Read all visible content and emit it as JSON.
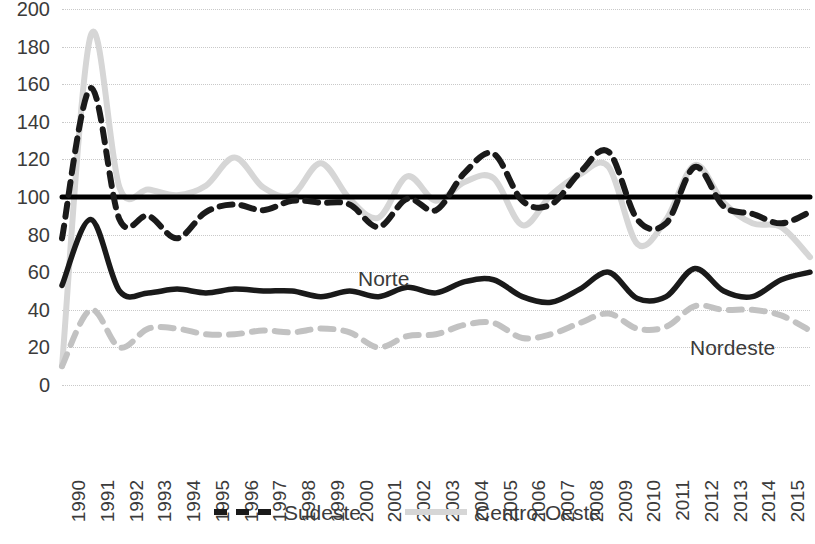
{
  "chart_data": {
    "type": "line",
    "title": "",
    "subtitle": "",
    "xlabel": "",
    "ylabel": "",
    "xlim": [
      1990,
      2016
    ],
    "ylim": [
      0,
      200
    ],
    "ytick_step": 20,
    "grid": true,
    "legend_position": "bottom",
    "x": [
      1990,
      1991,
      1992,
      1993,
      1994,
      1995,
      1996,
      1997,
      1998,
      1999,
      2000,
      2001,
      2002,
      2003,
      2004,
      2005,
      2006,
      2007,
      2008,
      2009,
      2010,
      2011,
      2012,
      2013,
      2014,
      2015,
      2016
    ],
    "categories": [
      "1990",
      "1991",
      "1992",
      "1993",
      "1994",
      "1995",
      "1996",
      "1997",
      "1998",
      "1999",
      "2000",
      "2001",
      "2002",
      "2003",
      "2004",
      "2005",
      "2006",
      "2007",
      "2008",
      "2009",
      "2010",
      "2011",
      "2012",
      "2013",
      "2014",
      "2015",
      "2016"
    ],
    "yticks": [
      "0",
      "20",
      "40",
      "60",
      "80",
      "100",
      "120",
      "140",
      "160",
      "180",
      "200"
    ],
    "series": [
      {
        "name": "Sudeste",
        "style": "dashed",
        "color": "#1a1a1a",
        "in_legend": true,
        "values": [
          78,
          158,
          88,
          90,
          78,
          92,
          96,
          93,
          98,
          97,
          96,
          84,
          99,
          93,
          113,
          123,
          98,
          96,
          113,
          124,
          88,
          86,
          116,
          95,
          91,
          86,
          92
        ]
      },
      {
        "name": "Centro-Oeste",
        "style": "solid",
        "color": "#d6d6d6",
        "in_legend": true,
        "values": [
          10,
          186,
          105,
          104,
          101,
          106,
          121,
          105,
          101,
          118,
          99,
          89,
          111,
          98,
          108,
          110,
          85,
          101,
          112,
          116,
          75,
          88,
          117,
          97,
          86,
          84,
          68
        ]
      },
      {
        "name": "Norte",
        "style": "solid",
        "color": "#1a1a1a",
        "in_legend": false,
        "inline_label": "Norte",
        "values": [
          53,
          88,
          50,
          49,
          51,
          49,
          51,
          50,
          50,
          47,
          50,
          47,
          52,
          49,
          55,
          56,
          47,
          44,
          51,
          60,
          46,
          47,
          62,
          50,
          47,
          56,
          60
        ]
      },
      {
        "name": "Nordeste",
        "style": "dashed",
        "color": "#c2c2c2",
        "in_legend": false,
        "inline_label": "Nordeste",
        "values": [
          10,
          40,
          20,
          30,
          30,
          27,
          27,
          29,
          28,
          30,
          28,
          20,
          26,
          27,
          32,
          33,
          25,
          27,
          33,
          38,
          30,
          31,
          42,
          40,
          40,
          37,
          29
        ]
      },
      {
        "name": "Reference",
        "style": "solid-thick",
        "color": "#000000",
        "in_legend": false,
        "values": [
          100,
          100,
          100,
          100,
          100,
          100,
          100,
          100,
          100,
          100,
          100,
          100,
          100,
          100,
          100,
          100,
          100,
          100,
          100,
          100,
          100,
          100,
          100,
          100,
          100,
          100,
          100
        ]
      }
    ],
    "legend": [
      {
        "label": "Sudeste",
        "color": "#1a1a1a",
        "style": "dashed"
      },
      {
        "label": "Centro-Oeste",
        "color": "#d6d6d6",
        "style": "solid"
      }
    ],
    "annotations": [
      {
        "text": "Norte",
        "x": 2001,
        "y": 58
      },
      {
        "text": "Nordeste",
        "x": 2013,
        "y": 23
      }
    ]
  }
}
